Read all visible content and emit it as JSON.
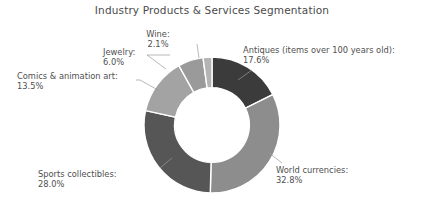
{
  "chart_data": {
    "type": "pie",
    "variant": "donut",
    "title": "Industry Products & Services Segmentation",
    "xlabel": "",
    "ylabel": "",
    "legend": "none",
    "grid": false,
    "start_angle_deg": 0,
    "direction": "clockwise",
    "hole_ratio": 0.55,
    "units": "percent",
    "categories": [
      "Antiques (items over 100 years old)",
      "World currencies",
      "Sports collectibles",
      "Comics & animation art",
      "Jewelry",
      "Wine"
    ],
    "values": [
      17.6,
      32.8,
      28.0,
      13.5,
      6.0,
      2.1
    ],
    "colors": [
      "#3b3b3b",
      "#8d8d8d",
      "#565656",
      "#a3a3a3",
      "#9a9a9a",
      "#b4b4b4"
    ],
    "slices": [
      {
        "name": "Antiques (items over 100 years old)",
        "value": 17.6,
        "label_name": "Antiques (items over 100 years old):",
        "label_pct": "17.6%",
        "color": "#3b3b3b"
      },
      {
        "name": "World currencies",
        "value": 32.8,
        "label_name": "World currencies:",
        "label_pct": "32.8%",
        "color": "#8d8d8d"
      },
      {
        "name": "Sports collectibles",
        "value": 28.0,
        "label_name": "Sports collectibles:",
        "label_pct": "28.0%",
        "color": "#565656"
      },
      {
        "name": "Comics & animation art",
        "value": 13.5,
        "label_name": "Comics & animation art:",
        "label_pct": "13.5%",
        "color": "#a3a3a3"
      },
      {
        "name": "Jewelry",
        "value": 6.0,
        "label_name": "Jewelry:",
        "label_pct": "6.0%",
        "color": "#9a9a9a"
      },
      {
        "name": "Wine",
        "value": 2.1,
        "label_name": "Wine:",
        "label_pct": "2.1%",
        "color": "#b4b4b4"
      }
    ]
  },
  "chart": {
    "title": "Industry Products & Services Segmentation",
    "background_color": "#ffffff",
    "text_color": "#4f4f4f",
    "separator_color": "#ffffff"
  }
}
